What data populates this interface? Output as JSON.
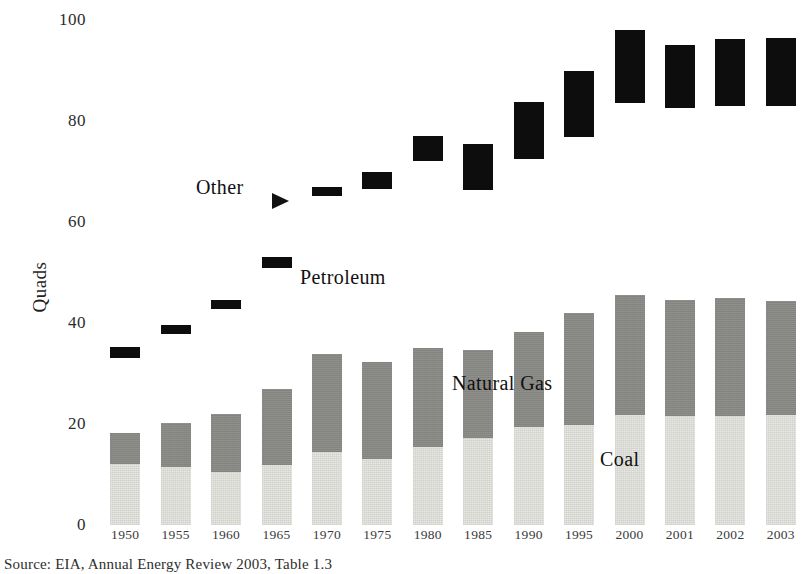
{
  "chart_data": {
    "type": "bar",
    "title": "",
    "subtitle": "",
    "xlabel": "",
    "ylabel": "Quads",
    "ylim": [
      0,
      100
    ],
    "yticks": [
      0,
      20,
      40,
      60,
      80,
      100
    ],
    "ytick_labels": [
      "0",
      "20",
      "40",
      "60",
      "80",
      "100"
    ],
    "grid": false,
    "legend_position": "in-plot annotations",
    "stacked": true,
    "note": "Stacked bars: Coal (bottom, light gray) and Natural Gas (medium gray) stack from zero; Petroleum/Other is drawn as a floating black range bar near the top of each year.",
    "categories": [
      "1950",
      "1955",
      "1960",
      "1965",
      "1970",
      "1975",
      "1980",
      "1985",
      "1990",
      "1995",
      "2000",
      "2001",
      "2002",
      "2003"
    ],
    "series": [
      {
        "name": "Coal",
        "color": "#e8e8e4",
        "type": "stacked-segment",
        "values": [
          12.0,
          11.5,
          10.5,
          11.8,
          14.4,
          13.0,
          15.5,
          17.3,
          19.5,
          19.8,
          21.8,
          21.5,
          21.5,
          21.8
        ]
      },
      {
        "name": "Natural Gas",
        "color": "#8d8d8a",
        "type": "stacked-segment",
        "values": [
          6.3,
          8.7,
          11.5,
          15.2,
          19.4,
          19.2,
          19.5,
          17.3,
          18.7,
          22.2,
          23.7,
          23.0,
          23.5,
          22.6
        ]
      },
      {
        "name": "Other",
        "color": "#0d0d0d",
        "type": "floating-range",
        "range_low": [
          33.0,
          37.8,
          42.7,
          50.8,
          65.2,
          66.5,
          72.0,
          66.3,
          72.5,
          76.8,
          83.5,
          82.5,
          83.0,
          83.0
        ],
        "range_high": [
          35.3,
          39.6,
          44.5,
          53.0,
          67.0,
          70.0,
          77.0,
          75.5,
          83.8,
          90.0,
          98.0,
          95.0,
          96.2,
          96.4
        ]
      }
    ],
    "stack_totals_gas_top": [
      18.3,
      20.2,
      22.0,
      27.0,
      33.8,
      32.2,
      35.0,
      34.6,
      38.2,
      42.0,
      45.5,
      44.5,
      45.0,
      44.4
    ]
  },
  "axis": {
    "y_title": "Quads",
    "y_tick_labels": [
      "100",
      "80",
      "60",
      "40",
      "20",
      "0"
    ],
    "x_tick_labels": [
      "1950",
      "1955",
      "1960",
      "1965",
      "1970",
      "1975",
      "1980",
      "1985",
      "1990",
      "1995",
      "2000",
      "2001",
      "2002",
      "2003"
    ]
  },
  "annotations": {
    "other": "Other",
    "petroleum": "Petroleum",
    "natural_gas": "Natural Gas",
    "coal": "Coal"
  },
  "footer": {
    "source": "Source: EIA, Annual Energy Review 2003, Table 1.3"
  },
  "colors": {
    "coal": "#e8e8e4",
    "natural_gas": "#8d8d8a",
    "other": "#0d0d0d",
    "background": "#ffffff",
    "text": "#1a1a1a"
  }
}
